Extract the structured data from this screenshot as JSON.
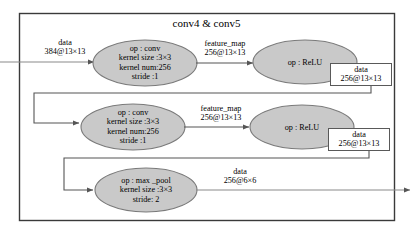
{
  "diagram": {
    "title": "conv4 & conv5",
    "frame_label": "conv4-conv5-group",
    "input_edge": {
      "line1": "data",
      "line2": "384@13×13"
    },
    "nodes": [
      {
        "id": "conv4",
        "lines": [
          "op : conv",
          "kernel size :3×3",
          "kernel num:256",
          "stride :1"
        ]
      },
      {
        "id": "relu4",
        "lines": [
          "op : ReLU"
        ]
      },
      {
        "id": "conv5",
        "lines": [
          "op : conv",
          "kernel size :3×3",
          "kernel num:256",
          "stride :1"
        ]
      },
      {
        "id": "relu5",
        "lines": [
          "op : ReLU"
        ]
      },
      {
        "id": "maxpool5",
        "lines": [
          "op : max _pool",
          "kernel size :3×3",
          "stride: 2"
        ]
      }
    ],
    "edges": [
      {
        "id": "conv4-to-relu4",
        "line1": "feature_map",
        "line2": "256@13×13"
      },
      {
        "id": "relu4-to-conv5",
        "line1": "data",
        "line2": "256@13×13"
      },
      {
        "id": "conv5-to-relu5",
        "line1": "feature_map",
        "line2": "256@13×13"
      },
      {
        "id": "relu5-to-maxpool5",
        "line1": "data",
        "line2": "256@13×13"
      },
      {
        "id": "maxpool5-out",
        "line1": "data",
        "line2": "256@6×6"
      }
    ],
    "colors": {
      "node_fill": "#c9c9c9",
      "node_stroke": "#7a7a7a",
      "edge_stroke": "#8a8a8a",
      "frame_stroke": "#3a3a3a",
      "text": "#000000",
      "background": "#ffffff"
    }
  }
}
